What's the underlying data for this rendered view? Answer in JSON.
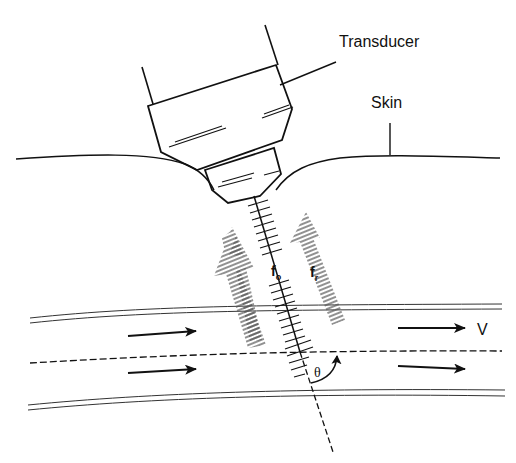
{
  "diagram": {
    "labels": {
      "transducer": "Transducer",
      "skin": "Skin",
      "velocity": "V",
      "transmitted_freq_base": "f",
      "transmitted_freq_sub": "o",
      "received_freq_base": "f",
      "received_freq_sub": "r",
      "angle": "θ"
    },
    "components": [
      "transducer",
      "skin-surface",
      "ultrasound-beam-axis",
      "transmitted-wave-arrow",
      "reflected-wave-arrow",
      "blood-vessel-walls",
      "vessel-centerline",
      "flow-arrows",
      "insonation-angle-arc"
    ],
    "colors": {
      "line": "#111111",
      "background": "#ffffff"
    }
  }
}
